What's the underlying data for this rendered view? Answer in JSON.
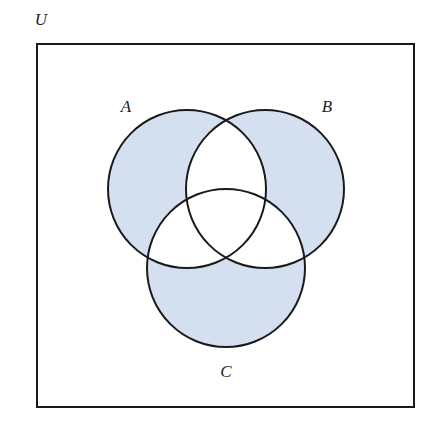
{
  "diagram": {
    "type": "venn",
    "universe": {
      "label": "U",
      "label_pos": [
        41,
        25
      ],
      "rect": {
        "x": 37,
        "y": 44,
        "width": 377,
        "height": 363
      }
    },
    "sets": [
      {
        "id": "A",
        "label": "A",
        "cx": 187,
        "cy": 189,
        "r": 79,
        "label_pos": [
          126,
          112
        ]
      },
      {
        "id": "B",
        "label": "B",
        "cx": 265,
        "cy": 189,
        "r": 79,
        "label_pos": [
          327,
          112
        ]
      },
      {
        "id": "C",
        "label": "C",
        "cx": 226,
        "cy": 268,
        "r": 79,
        "label_pos": [
          226,
          377
        ]
      }
    ],
    "shaded_regions": [
      "A only",
      "B only",
      "C only"
    ],
    "colors": {
      "fill": "#d4e0ef",
      "stroke": "#1a1a1a",
      "background": "#ffffff"
    }
  }
}
